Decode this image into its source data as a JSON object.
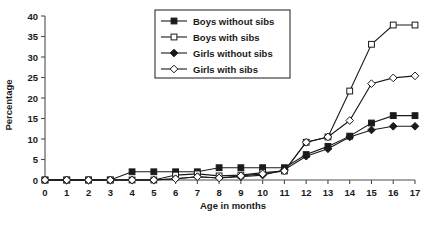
{
  "chart_data": {
    "type": "line",
    "title": "",
    "xlabel": "Age in months",
    "ylabel": "Percentage",
    "xlim": [
      0,
      17
    ],
    "ylim": [
      0,
      40
    ],
    "grid": false,
    "legend_position": "top-center",
    "x": [
      0,
      1,
      2,
      3,
      4,
      5,
      6,
      7,
      8,
      9,
      10,
      11,
      12,
      13,
      14,
      15,
      16,
      17
    ],
    "categories": [
      "0",
      "1",
      "2",
      "3",
      "4",
      "5",
      "6",
      "7",
      "8",
      "9",
      "10",
      "11",
      "12",
      "13",
      "14",
      "15",
      "16",
      "17"
    ],
    "xticks": [
      "0",
      "1",
      "2",
      "3",
      "4",
      "5",
      "6",
      "7",
      "8",
      "9",
      "10",
      "11",
      "12",
      "13",
      "14",
      "15",
      "16",
      "17"
    ],
    "yticks": [
      "0",
      "5",
      "10",
      "15",
      "20",
      "25",
      "30",
      "35",
      "40"
    ],
    "series": [
      {
        "name": "Boys without sibs",
        "marker": "filled-square",
        "values": [
          0,
          0,
          0,
          0,
          2.0,
          2.0,
          2.0,
          2.0,
          3.0,
          3.0,
          3.0,
          3.0,
          6.2,
          8.2,
          10.7,
          13.9,
          15.7,
          15.7
        ]
      },
      {
        "name": "Boys with sibs",
        "marker": "open-square",
        "values": [
          0,
          0,
          0,
          0,
          0,
          0,
          1.2,
          1.5,
          1.0,
          1.2,
          1.8,
          2.2,
          9.2,
          10.5,
          21.7,
          33.1,
          37.8,
          37.8
        ]
      },
      {
        "name": "Girls without sibs",
        "marker": "filled-diamond",
        "values": [
          0,
          0,
          0,
          0,
          0,
          0,
          0.3,
          0.8,
          0.5,
          0.8,
          1.2,
          2.5,
          5.8,
          7.6,
          10.5,
          12.2,
          13.1,
          13.1
        ]
      },
      {
        "name": "Girls with sibs",
        "marker": "open-diamond",
        "values": [
          0,
          0,
          0,
          0,
          0,
          0,
          0.3,
          0.8,
          0.5,
          1.0,
          1.5,
          2.2,
          9.2,
          10.5,
          14.5,
          23.5,
          24.9,
          25.4
        ]
      }
    ],
    "colors": {
      "line": "#1a1a1a",
      "axis": "#4d4d4d",
      "text": "#1a1a1a",
      "background": "#ffffff"
    }
  },
  "legend": {
    "items": [
      {
        "label": "Boys without sibs"
      },
      {
        "label": "Boys with sibs"
      },
      {
        "label": "Girls without sibs"
      },
      {
        "label": "Girls with sibs"
      }
    ]
  }
}
